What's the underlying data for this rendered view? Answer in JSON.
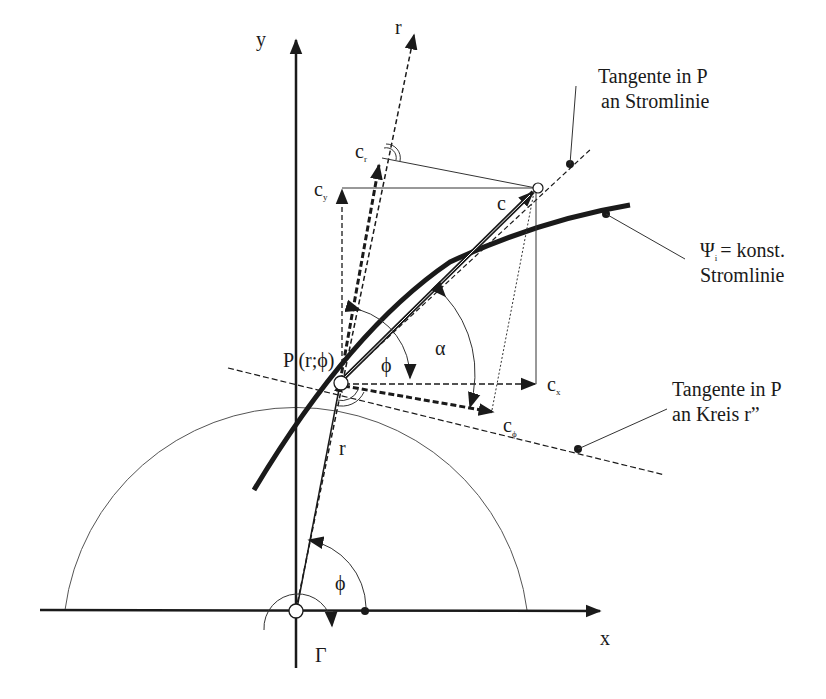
{
  "axes": {
    "x_label": "x",
    "y_label": "y",
    "r_axis_label": "r"
  },
  "point": {
    "label": "P (r;ϕ)"
  },
  "vectors": {
    "c": "c",
    "c_r": {
      "base": "c",
      "sub": "r"
    },
    "c_y": {
      "base": "c",
      "sub": "y"
    },
    "c_x": {
      "base": "c",
      "sub": "x"
    },
    "c_phi": {
      "base": "c",
      "sub": "ϕ"
    }
  },
  "angles": {
    "phi_upper": "ϕ",
    "alpha": "α",
    "phi_lower": "ϕ"
  },
  "radius_label": "r",
  "circulation_label": "Γ",
  "annotations": {
    "streamline_tangent": {
      "line1": "Tangente in P",
      "line2": "an Stromlinie"
    },
    "streamline": {
      "psi": "Ψ",
      "psi_sub": "i",
      "line1_rest": "= konst.",
      "line2": "Stromlinie"
    },
    "circle_tangent": {
      "line1": "Tangente in P",
      "line2": "an Kreis  r”"
    }
  },
  "colors": {
    "ink": "#1a1a1a",
    "background": "#ffffff"
  }
}
